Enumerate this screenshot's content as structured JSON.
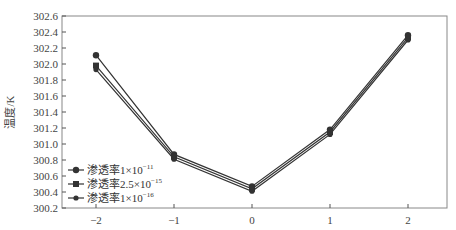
{
  "chart_data": {
    "type": "line",
    "title": "",
    "xlabel": "",
    "ylabel": "温度/K",
    "x": [
      -2,
      -1,
      0,
      1,
      2
    ],
    "xticks": [
      "−2",
      "−1",
      "0",
      "1",
      "2"
    ],
    "yticks": [
      "300.2",
      "300.4",
      "300.6",
      "300.8",
      "301.0",
      "301.2",
      "301.4",
      "301.6",
      "301.8",
      "302.0",
      "302.2",
      "302.4",
      "302.6"
    ],
    "ylim": [
      300.2,
      302.6
    ],
    "xlim": [
      -2.4,
      2.5
    ],
    "grid": false,
    "legend_position": "lower-left",
    "series": [
      {
        "name": "渗透率1×10⁻¹¹",
        "base": "渗透率1×10",
        "exp": "−11",
        "marker": "circle",
        "values": [
          302.11,
          300.87,
          300.47,
          301.18,
          302.36
        ]
      },
      {
        "name": "渗透率2.5×10⁻¹⁵",
        "base": "渗透率2.5×10",
        "exp": "−15",
        "marker": "square",
        "values": [
          301.98,
          300.84,
          300.44,
          301.15,
          302.33
        ]
      },
      {
        "name": "渗透率1×10⁻¹⁶",
        "base": "渗透率1×10",
        "exp": "−16",
        "marker": "dot",
        "values": [
          301.93,
          300.81,
          300.41,
          301.12,
          302.3
        ]
      }
    ],
    "colors": {
      "line": "#333333",
      "axis": "#555555"
    }
  }
}
